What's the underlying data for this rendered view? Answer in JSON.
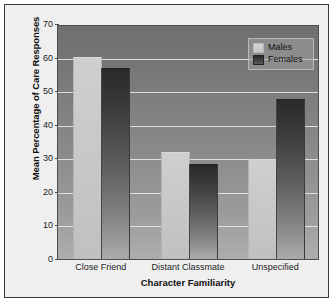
{
  "chart_data": {
    "type": "bar",
    "title": "",
    "xlabel": "Character Familiarity",
    "ylabel": "Mean Percentage of Care Responses",
    "categories": [
      "Close Friend",
      "Distant Classmate",
      "Unspecified"
    ],
    "series": [
      {
        "name": "Males",
        "values": [
          60.0,
          31.5,
          29.5
        ],
        "color": "#c9c9c9"
      },
      {
        "name": "Females",
        "values": [
          56.5,
          28.0,
          47.5
        ],
        "color": "#3a3a3a"
      }
    ],
    "ylim": [
      0,
      70
    ],
    "yticks": [
      0,
      10,
      20,
      30,
      40,
      50,
      60,
      70
    ],
    "ytick_labels": [
      "0",
      "10",
      "20",
      "30",
      "40",
      "50",
      "60",
      "70"
    ],
    "grid": true,
    "grid_axis": "y",
    "legend_position": "top-right",
    "plot_background": "gray-vertical-gradient"
  },
  "legend": {
    "entries": [
      {
        "label": "Males",
        "swatch": "light-gray-swatch"
      },
      {
        "label": "Females",
        "swatch": "dark-gray-swatch"
      }
    ]
  }
}
